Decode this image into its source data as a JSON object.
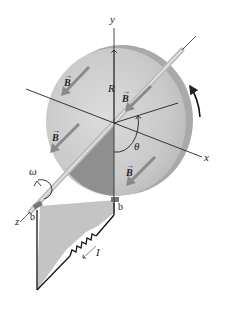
{
  "figure": {
    "axes": {
      "x_label": "x",
      "y_label": "y",
      "z_label": "z"
    },
    "labels": {
      "radius": "R",
      "angle": "θ",
      "angular_velocity": "ω",
      "current": "I",
      "brush_left": "b",
      "brush_right": "b",
      "field": "B"
    },
    "field_arrows": [
      {
        "id": "b1",
        "label": "B"
      },
      {
        "id": "b2",
        "label": "B"
      },
      {
        "id": "b3",
        "label": "B"
      },
      {
        "id": "b4",
        "label": "B"
      }
    ],
    "colors": {
      "disk_face": "#c8c8c8",
      "disk_rim": "#a8a8a8",
      "disk_shadow_sector": "#8e8e8e",
      "loop_fill": "#c4c4c4",
      "field_arrow": "#8a8a8a",
      "line": "#222222"
    }
  }
}
